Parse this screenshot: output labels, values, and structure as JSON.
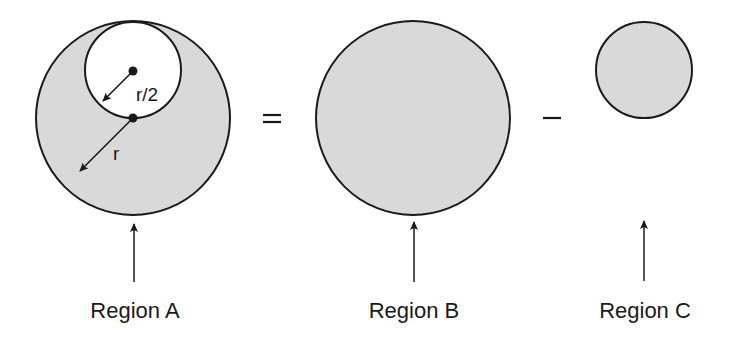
{
  "diagram": {
    "colors": {
      "fill": "#d9d9d9",
      "stroke": "#1a1a1a",
      "background": "#ffffff"
    },
    "operators": {
      "equals": "=",
      "minus": "–"
    },
    "region_a": {
      "label": "Region A",
      "outer_radius_label": "r",
      "inner_radius_label": "r/2"
    },
    "region_b": {
      "label": "Region B"
    },
    "region_c": {
      "label": "Region C"
    }
  }
}
